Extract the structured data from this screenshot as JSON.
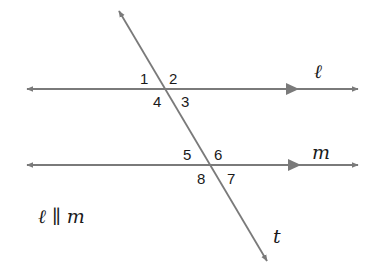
{
  "diagram": {
    "type": "parallel-lines-cut-by-transversal",
    "colors": {
      "line": "#7a7a7a",
      "text": "#1a1a1a",
      "background": "#ffffff"
    },
    "lines": {
      "l": {
        "label": "ℓ",
        "y": 89,
        "x_start": 25,
        "x_end": 360
      },
      "m": {
        "label": "m",
        "y": 165,
        "x_start": 25,
        "x_end": 360
      },
      "t": {
        "label": "t",
        "x1": 118,
        "y1": 10,
        "x2": 268,
        "y2": 262
      }
    },
    "angles": {
      "a1": "1",
      "a2": "2",
      "a3": "3",
      "a4": "4",
      "a5": "5",
      "a6": "6",
      "a7": "7",
      "a8": "8"
    },
    "relation": "ℓ ∥ m"
  }
}
